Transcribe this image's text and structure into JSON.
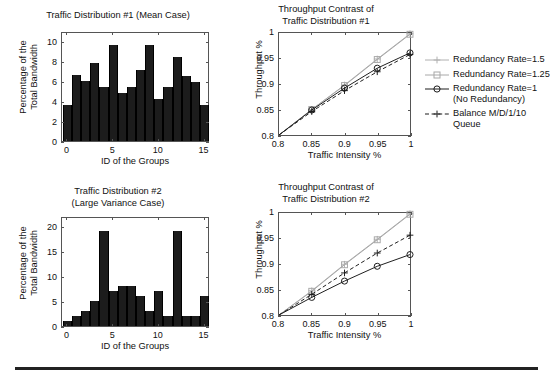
{
  "figure": {
    "width": 553,
    "height": 383,
    "background": "#ffffff",
    "divider_color": "#222222"
  },
  "legend": {
    "position": "right",
    "items": [
      {
        "label": "Redundancy Rate=1.5",
        "marker": "plus",
        "line": "solid",
        "color": "#b0b0b0"
      },
      {
        "label": "Redundancy Rate=1.25",
        "marker": "square",
        "line": "solid",
        "color": "#a8a8a8"
      },
      {
        "label": "Redundancy Rate=1\n(No Redundancy)",
        "marker": "circle",
        "line": "solid",
        "color": "#1c1c1c"
      },
      {
        "label": "Balance M/D/1/10 Queue",
        "marker": "plus",
        "line": "dashed",
        "color": "#1c1c1c"
      }
    ]
  },
  "chart_data": [
    {
      "id": "traffic-distribution-1",
      "type": "bar",
      "title": "Traffic Distribution #1 (Mean Case)",
      "xlabel": "ID of the Groups",
      "ylabel": "Percentage of the\nTotal Bandwidth",
      "xlim": [
        -0.6,
        15.6
      ],
      "ylim": [
        0,
        11
      ],
      "xticks": [
        0,
        5,
        10,
        15
      ],
      "xticklabels": [
        "0",
        "5",
        "10",
        "15"
      ],
      "yticks": [
        0,
        2,
        4,
        6,
        8,
        10
      ],
      "yticklabels": [
        "0",
        "2",
        "4",
        "6",
        "8",
        "10"
      ],
      "grid": false,
      "bar_color": "#1c1c1c",
      "categories": [
        0,
        1,
        2,
        3,
        4,
        5,
        6,
        7,
        8,
        9,
        10,
        11,
        12,
        13,
        14,
        15
      ],
      "values": [
        3.6,
        6.6,
        6.0,
        7.8,
        5.4,
        9.6,
        4.8,
        5.4,
        7.1,
        9.6,
        4.2,
        5.4,
        8.4,
        6.5,
        5.9,
        3.6
      ]
    },
    {
      "id": "throughput-contrast-1",
      "type": "line",
      "title": "Throughput Contrast of\nTraffic Distribution #1",
      "xlabel": "Traffic Intensity %",
      "ylabel": "Throughput %",
      "xlim": [
        0.8,
        1.0
      ],
      "ylim": [
        0.8,
        1.0
      ],
      "xticks": [
        0.8,
        0.85,
        0.9,
        0.95,
        1
      ],
      "xticklabels": [
        "0.8",
        "0.85",
        "0.9",
        "0.95",
        "1"
      ],
      "yticks": [
        0.8,
        0.85,
        0.9,
        0.95,
        1
      ],
      "yticklabels": [
        "0.8",
        "0.85",
        "0.9",
        "0.95",
        "1"
      ],
      "grid": false,
      "x": [
        0.8,
        0.85,
        0.9,
        0.95,
        1.0
      ],
      "series": [
        {
          "name": "Redundancy Rate=1.5",
          "values": [
            0.8,
            0.85,
            0.898,
            0.949,
            0.9985
          ],
          "color": "#b0b0b0",
          "marker": "plus",
          "line": "solid"
        },
        {
          "name": "Redundancy Rate=1.25",
          "values": [
            0.8,
            0.85,
            0.897,
            0.948,
            0.9975
          ],
          "color": "#a8a8a8",
          "marker": "square",
          "line": "solid"
        },
        {
          "name": "Redundancy Rate=1 (No Redundancy)",
          "values": [
            0.8,
            0.849,
            0.892,
            0.931,
            0.961
          ],
          "color": "#1c1c1c",
          "marker": "circle",
          "line": "solid"
        },
        {
          "name": "Balance M/D/1/10 Queue",
          "values": [
            0.8,
            0.846,
            0.887,
            0.924,
            0.958
          ],
          "color": "#1c1c1c",
          "marker": "plus",
          "line": "dashed"
        }
      ]
    },
    {
      "id": "traffic-distribution-2",
      "type": "bar",
      "title": "Traffic Distribution #2\n(Large Variance Case)",
      "xlabel": "ID of the Groups",
      "ylabel": "Percentage of the\nTotal Bandwidth",
      "xlim": [
        -0.6,
        15.6
      ],
      "ylim": [
        0,
        22
      ],
      "xticks": [
        0,
        5,
        10,
        15
      ],
      "xticklabels": [
        "0",
        "5",
        "10",
        "15"
      ],
      "yticks": [
        0,
        5,
        10,
        15,
        20
      ],
      "yticklabels": [
        "0",
        "5",
        "10",
        "15",
        "20"
      ],
      "grid": false,
      "bar_color": "#1c1c1c",
      "categories": [
        0,
        1,
        2,
        3,
        4,
        5,
        6,
        7,
        8,
        9,
        10,
        11,
        12,
        13,
        14,
        15
      ],
      "values": [
        1,
        2,
        3,
        5,
        19,
        7,
        8,
        8,
        6,
        3,
        7,
        2,
        19,
        2,
        2,
        6
      ]
    },
    {
      "id": "throughput-contrast-2",
      "type": "line",
      "title": "Throughput Contrast of\nTraffic Distribution #2",
      "xlabel": "Traffic Intensity %",
      "ylabel": "Throughput %",
      "xlim": [
        0.8,
        1.0
      ],
      "ylim": [
        0.8,
        1.0
      ],
      "xticks": [
        0.8,
        0.85,
        0.9,
        0.95,
        1
      ],
      "xticklabels": [
        "0.8",
        "0.85",
        "0.9",
        "0.95",
        "1"
      ],
      "yticks": [
        0.8,
        0.85,
        0.9,
        0.95,
        1
      ],
      "yticklabels": [
        "0.8",
        "0.85",
        "0.9",
        "0.95",
        "1"
      ],
      "grid": false,
      "x": [
        0.8,
        0.85,
        0.9,
        0.95,
        1.0
      ],
      "series": [
        {
          "name": "Redundancy Rate=1.5",
          "values": [
            0.8,
            0.8475,
            0.8995,
            0.9485,
            0.9985
          ],
          "color": "#b0b0b0",
          "marker": "plus",
          "line": "solid"
        },
        {
          "name": "Redundancy Rate=1.25",
          "values": [
            0.8,
            0.8465,
            0.8985,
            0.9475,
            0.9975
          ],
          "color": "#a8a8a8",
          "marker": "square",
          "line": "solid"
        },
        {
          "name": "Redundancy Rate=1 (No Redundancy)",
          "values": [
            0.8,
            0.8345,
            0.8665,
            0.8955,
            0.9185
          ],
          "color": "#1c1c1c",
          "marker": "circle",
          "line": "solid"
        },
        {
          "name": "Balance M/D/1/10 Queue",
          "values": [
            0.8,
            0.8405,
            0.8825,
            0.9215,
            0.9565
          ],
          "color": "#1c1c1c",
          "marker": "plus",
          "line": "dashed"
        }
      ]
    }
  ]
}
